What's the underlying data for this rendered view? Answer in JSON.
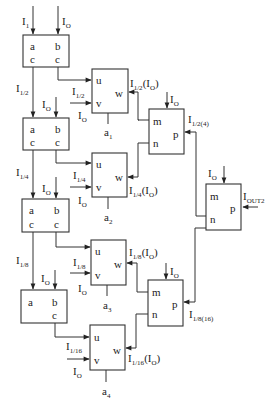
{
  "diagram": {
    "type": "block-diagram",
    "splitter_blocks": [
      {
        "id": "S1",
        "ports": [
          "a",
          "b",
          "c",
          "c"
        ],
        "inputs": {
          "a": "I1",
          "b": "IO"
        }
      },
      {
        "id": "S2",
        "ports": [
          "a",
          "b",
          "c",
          "c"
        ],
        "inputs": {
          "a": "I1/2",
          "b": "IO"
        }
      },
      {
        "id": "S3",
        "ports": [
          "a",
          "b",
          "c",
          "c"
        ],
        "inputs": {
          "a": "I1/4",
          "b": "IO"
        }
      },
      {
        "id": "S4",
        "ports": [
          "a",
          "b",
          "c"
        ],
        "inputs": {
          "a": "I1/8",
          "b": "IO"
        }
      }
    ],
    "adder_blocks": [
      {
        "id": "a1",
        "label": "a1",
        "ports": [
          "u",
          "v",
          "w"
        ],
        "v_input": "I1/2",
        "v_ref": "IO",
        "output": "I1/2(IO)"
      },
      {
        "id": "a2",
        "label": "a2",
        "ports": [
          "u",
          "v",
          "w"
        ],
        "v_input": "I1/4",
        "v_ref": "IO",
        "output": "I1/4(IO)"
      },
      {
        "id": "a3",
        "label": "a3",
        "ports": [
          "u",
          "v",
          "w"
        ],
        "v_input": "I1/8",
        "v_ref": "IO",
        "output": "I1/8(IO)"
      },
      {
        "id": "a4",
        "label": "a4",
        "ports": [
          "u",
          "v",
          "w"
        ],
        "v_input": "I1/16",
        "v_ref": "IO",
        "output": "I1/16(IO)"
      }
    ],
    "combiner_blocks": [
      {
        "id": "C1",
        "ports": [
          "m",
          "n",
          "p"
        ],
        "top_input": "IO",
        "output": "I1/2(4)"
      },
      {
        "id": "C2",
        "ports": [
          "m",
          "n",
          "p"
        ],
        "top_input": "IO",
        "output": "I1/8(16)"
      },
      {
        "id": "C3",
        "ports": [
          "m",
          "n",
          "p"
        ],
        "top_input": "IO",
        "output": "IOUT2"
      }
    ]
  },
  "labels": {
    "port_a": "a",
    "port_b": "b",
    "port_c": "c",
    "port_u": "u",
    "port_v": "v",
    "port_w": "w",
    "port_m": "m",
    "port_n": "n",
    "port_p": "p",
    "I": "I",
    "sub_1": "1",
    "sub_O": "O",
    "sub_12": "1/2",
    "sub_14": "1/4",
    "sub_18": "1/8",
    "sub_116": "1/16",
    "sub_124": "1/2(4)",
    "sub_1816": "1/8(16)",
    "sub_OUT2": "OUT2",
    "paren_open": "(",
    "paren_close": ")",
    "a": "a",
    "sub_a1": "1",
    "sub_a2": "2",
    "sub_a3": "3",
    "sub_a4": "4"
  }
}
